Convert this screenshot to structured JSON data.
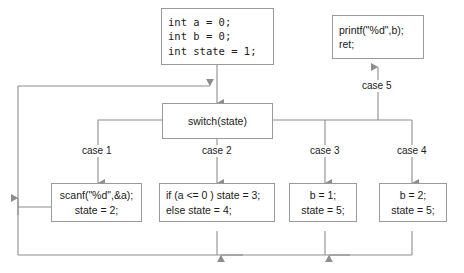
{
  "diagram": {
    "stroke_color": "#9a9a9a",
    "text_color": "#1a1a1a",
    "background": "#ffffff"
  },
  "nodes": {
    "init": {
      "name": "init-block",
      "lines": [
        "int a = 0;",
        "int b = 0;",
        "int state = 1;"
      ]
    },
    "output": {
      "name": "output-block",
      "lines": [
        "printf(\"%d\",b);",
        "ret;"
      ]
    },
    "switch": {
      "name": "switch-block",
      "lines": [
        "switch(state)"
      ]
    },
    "case1_body": {
      "name": "case1-block",
      "lines": [
        "scanf(\"%d\",&a);",
        "state = 2;"
      ]
    },
    "case2_body": {
      "name": "case2-block",
      "lines": [
        "if (a <= 0 ) state = 3;",
        "else state = 4;"
      ]
    },
    "case3_body": {
      "name": "case3-block",
      "lines": [
        "b = 1;",
        "state = 5;"
      ]
    },
    "case4_body": {
      "name": "case4-block",
      "lines": [
        "b = 2;",
        "state = 5;"
      ]
    }
  },
  "edge_labels": {
    "case1": "case 1",
    "case2": "case 2",
    "case3": "case 3",
    "case4": "case 4",
    "case5": "case 5"
  }
}
